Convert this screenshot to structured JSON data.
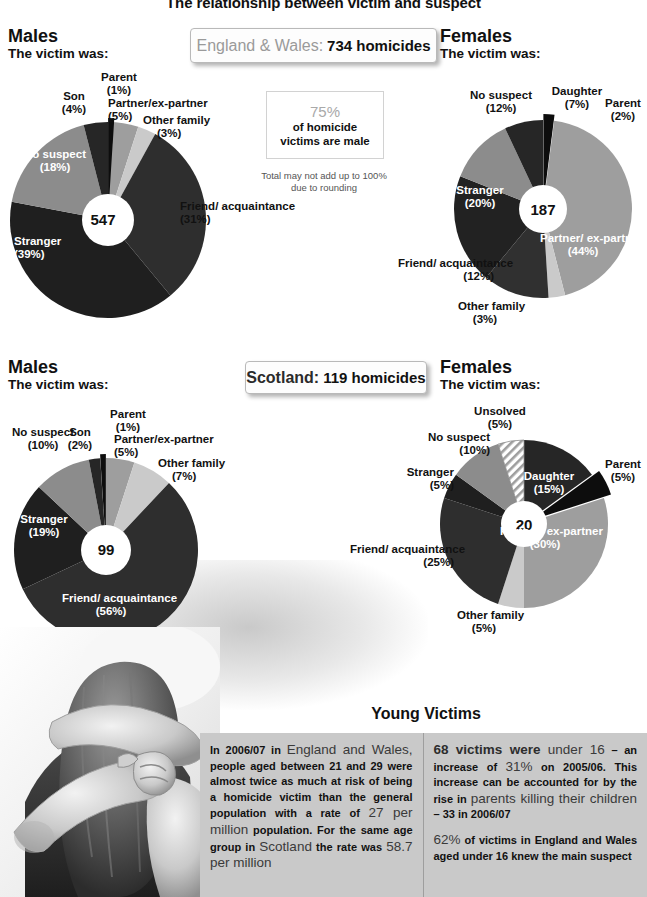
{
  "title": "The relationship between victim and suspect",
  "sections": {
    "england_wales": {
      "region_label": "England & Wales:",
      "count_label": "734 homicides",
      "male": {
        "heading": "Males",
        "subheading": "The victim was:"
      },
      "female": {
        "heading": "Females",
        "subheading": "The victim was:"
      }
    },
    "scotland": {
      "region_label": "Scotland:",
      "count_label": "119 homicides",
      "male": {
        "heading": "Males",
        "subheading": "The victim was:"
      },
      "female": {
        "heading": "Females",
        "subheading": "The victim was:"
      }
    }
  },
  "fact_box": {
    "number": "75%",
    "line1": "of homicide",
    "line2": "victims are male"
  },
  "rounding_note": "Total may not add up to 100% due to rounding",
  "young_victims": {
    "title": "Young Victims",
    "left_paragraph": "In 2006/07 in England and Wales, people aged between 21 and 29 were almost twice as much at risk of being a homicide victim than the general population with a rate of 27 per million population. For the same age group in Scotland the rate was 58.7 per million",
    "left_parts": {
      "p1a": "In 2006/07 in ",
      "p1b": "England and Wales,",
      "p1c": " people aged between 21 and 29 were almost twice as much at risk of being a homicide victim than the general population with a rate of ",
      "p1d": "27 per million",
      "p1e": " population. For the same age group in ",
      "p1f": "Scotland",
      "p1g": " the rate was ",
      "p1h": "58.7 per million"
    },
    "right_parts": {
      "p1a": "68 victims were ",
      "p1b": "under 16",
      "p1c": " – an increase of ",
      "p1d": "31%",
      "p1e": " on 2005/06. This increase can be accounted for by the rise in ",
      "p1f": "parents killing their children",
      "p1g": " – 33 in 2006/07",
      "p2a": "62%",
      "p2b": " of victims in England and Wales aged under 16 knew the main suspect"
    },
    "right_paragraph_1": "68 victims were under 16 – an increase of 31% on 2005/06. This increase can be accounted for by the rise in parents killing their children – 33 in 2006/07",
    "right_paragraph_2": "62% of victims in England and Wales aged under 16 knew the main suspect"
  },
  "colors": {
    "slice_darkest": "#1a1a1a",
    "slice_dark": "#2e2e2e",
    "slice_mid_dark": "#3b3b3b",
    "slice_mid": "#6e6e6e",
    "slice_light": "#a6a6a6",
    "slice_lighter": "#bdbdbd",
    "slice_lightest": "#d4d4d4",
    "pie_center": "#ffffff",
    "panel_bg": "#c9c9c9",
    "muted_text": "#9a9a9a"
  },
  "chart_data": [
    {
      "id": "ew-males",
      "type": "pie",
      "title": "England & Wales – Males",
      "subtitle": "The victim was:",
      "center_value": "547",
      "total_label": "547",
      "legend_position": "callout-labels",
      "categories": [
        "Friend/ acquaintance",
        "Stranger",
        "No suspect",
        "Son",
        "Parent",
        "Partner/ex-partner",
        "Other family"
      ],
      "values": [
        31,
        39,
        18,
        4,
        1,
        5,
        3
      ],
      "slices": [
        {
          "label": "Friend/ acquaintance",
          "percent": 31,
          "pct_label": "(31%)",
          "color": "#2e2e2e",
          "exploded": false
        },
        {
          "label": "Stranger",
          "percent": 39,
          "pct_label": "(39%)",
          "color": "#1f1f1f",
          "exploded": false
        },
        {
          "label": "No suspect",
          "percent": 18,
          "pct_label": "(18%)",
          "color": "#8c8c8c",
          "exploded": false
        },
        {
          "label": "Son",
          "percent": 4,
          "pct_label": "(4%)",
          "color": "#262626",
          "exploded": false
        },
        {
          "label": "Parent",
          "percent": 1,
          "pct_label": "(1%)",
          "color": "#0d0d0d",
          "exploded": true
        },
        {
          "label": "Partner/ex-partner",
          "percent": 5,
          "pct_label": "(5%)",
          "color": "#9e9e9e",
          "exploded": false
        },
        {
          "label": "Other family",
          "percent": 3,
          "pct_label": "(3%)",
          "color": "#cacaca",
          "exploded": false
        }
      ]
    },
    {
      "id": "ew-females",
      "type": "pie",
      "title": "England & Wales – Females",
      "subtitle": "The victim was:",
      "center_value": "187",
      "total_label": "187",
      "legend_position": "callout-labels",
      "categories": [
        "Partner/ ex-partner",
        "Other family",
        "Friend/ acquaintance",
        "Stranger",
        "No suspect",
        "Daughter",
        "Parent"
      ],
      "values": [
        44,
        3,
        12,
        20,
        12,
        7,
        2
      ],
      "slices": [
        {
          "label": "Partner/ ex-partner",
          "percent": 44,
          "pct_label": "(44%)",
          "color": "#9e9e9e",
          "exploded": false
        },
        {
          "label": "Other family",
          "percent": 3,
          "pct_label": "(3%)",
          "color": "#cacaca",
          "exploded": false
        },
        {
          "label": "Friend/ acquaintance",
          "percent": 12,
          "pct_label": "(12%)",
          "color": "#303030",
          "exploded": false
        },
        {
          "label": "Stranger",
          "percent": 20,
          "pct_label": "(20%)",
          "color": "#222222",
          "exploded": false
        },
        {
          "label": "No suspect",
          "percent": 12,
          "pct_label": "(12%)",
          "color": "#8c8c8c",
          "exploded": false
        },
        {
          "label": "Daughter",
          "percent": 7,
          "pct_label": "(7%)",
          "color": "#262626",
          "exploded": false
        },
        {
          "label": "Parent",
          "percent": 2,
          "pct_label": "(2%)",
          "color": "#0d0d0d",
          "exploded": true
        }
      ]
    },
    {
      "id": "sc-males",
      "type": "pie",
      "title": "Scotland – Males",
      "subtitle": "The victim was:",
      "center_value": "99",
      "total_label": "99",
      "legend_position": "callout-labels",
      "categories": [
        "Friend/ acquaintance",
        "Stranger",
        "No suspect",
        "Son",
        "Parent",
        "Partner/ex-partner",
        "Other family"
      ],
      "values": [
        56,
        19,
        10,
        2,
        1,
        5,
        7
      ],
      "slices": [
        {
          "label": "Friend/ acquaintance",
          "percent": 56,
          "pct_label": "(56%)",
          "color": "#2e2e2e",
          "exploded": false
        },
        {
          "label": "Stranger",
          "percent": 19,
          "pct_label": "(19%)",
          "color": "#1f1f1f",
          "exploded": false
        },
        {
          "label": "No suspect",
          "percent": 10,
          "pct_label": "(10%)",
          "color": "#8c8c8c",
          "exploded": false
        },
        {
          "label": "Son",
          "percent": 2,
          "pct_label": "(2%)",
          "color": "#262626",
          "exploded": false
        },
        {
          "label": "Parent",
          "percent": 1,
          "pct_label": "(1%)",
          "color": "#0d0d0d",
          "exploded": true
        },
        {
          "label": "Partner/ex-partner",
          "percent": 5,
          "pct_label": "(5%)",
          "color": "#9e9e9e",
          "exploded": false
        },
        {
          "label": "Other family",
          "percent": 7,
          "pct_label": "(7%)",
          "color": "#cacaca",
          "exploded": false
        }
      ]
    },
    {
      "id": "sc-females",
      "type": "pie",
      "title": "Scotland – Females",
      "subtitle": "The victim was:",
      "center_value": "20",
      "total_label": "20",
      "legend_position": "callout-labels",
      "categories": [
        "Daughter",
        "Parent",
        "Partner/ ex-partner",
        "Other family",
        "Friend/ acquaintance",
        "Stranger",
        "No suspect",
        "Unsolved"
      ],
      "values": [
        15,
        5,
        30,
        5,
        25,
        5,
        10,
        5
      ],
      "slices": [
        {
          "label": "Daughter",
          "percent": 15,
          "pct_label": "(15%)",
          "color": "#262626",
          "exploded": false
        },
        {
          "label": "Parent",
          "percent": 5,
          "pct_label": "(5%)",
          "color": "#0d0d0d",
          "exploded": true
        },
        {
          "label": "Partner/ ex-partner",
          "percent": 30,
          "pct_label": "(30%)",
          "color": "#9e9e9e",
          "exploded": false
        },
        {
          "label": "Other family",
          "percent": 5,
          "pct_label": "(5%)",
          "color": "#cacaca",
          "exploded": false
        },
        {
          "label": "Friend/ acquaintance",
          "percent": 25,
          "pct_label": "(25%)",
          "color": "#2e2e2e",
          "exploded": false
        },
        {
          "label": "Stranger",
          "percent": 5,
          "pct_label": "(5%)",
          "color": "#1f1f1f",
          "exploded": false
        },
        {
          "label": "No suspect",
          "percent": 10,
          "pct_label": "(10%)",
          "color": "#8c8c8c",
          "exploded": false
        },
        {
          "label": "Unsolved",
          "percent": 5,
          "pct_label": "(5%)",
          "color": "hatched",
          "exploded": false
        }
      ]
    }
  ]
}
